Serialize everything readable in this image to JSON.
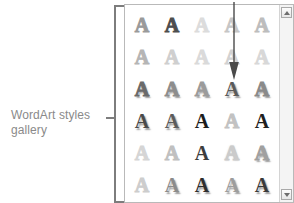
{
  "figure": {
    "width": 294,
    "height": 203,
    "background": "#ffffff"
  },
  "callout": {
    "label": "WordArt styles\ngallery",
    "text_color": "#8a8a8a",
    "bracket_color": "#7d7d7d",
    "bracket_name": "bracket-leader"
  },
  "annotation": {
    "arrow_name": "pointer-arrow",
    "arrow_color": "#4a4a4a",
    "points_to_row": 3,
    "points_to_column": 4
  },
  "gallery": {
    "title": "WordArt styles gallery",
    "panel_border": "#b9b9b9",
    "panel_background": "#ffffff",
    "columns": 5,
    "visible_rows": 6,
    "sample_letter": "A",
    "rows": [
      {
        "row": 1,
        "cells": [
          {
            "letter": "A",
            "style": "outline",
            "color": "#9a9a9a"
          },
          {
            "letter": "A",
            "style": "outline",
            "color": "#4e4e4e"
          },
          {
            "letter": "A",
            "style": "outline",
            "color": "#dcdcdc"
          },
          {
            "letter": "A",
            "style": "outline",
            "color": "#c6c6c6"
          },
          {
            "letter": "A",
            "style": "outline",
            "color": "#bdbdbd"
          }
        ]
      },
      {
        "row": 2,
        "cells": [
          {
            "letter": "A",
            "style": "outline",
            "color": "#b5b5b5"
          },
          {
            "letter": "A",
            "style": "outline",
            "color": "#cfcfcf"
          },
          {
            "letter": "A",
            "style": "outline",
            "color": "#dadada"
          },
          {
            "letter": "A",
            "style": "outline",
            "color": "#d2d2d2"
          },
          {
            "letter": "A",
            "style": "outline",
            "color": "#d8d8d8"
          }
        ]
      },
      {
        "row": 3,
        "cells": [
          {
            "letter": "A",
            "style": "outline-shadow",
            "color": "#6a6a6a"
          },
          {
            "letter": "A",
            "style": "outline-shadow",
            "color": "#8d8d8d"
          },
          {
            "letter": "A",
            "style": "outline-shadow",
            "color": "#9b9b9b"
          },
          {
            "letter": "A",
            "style": "solid-shadow",
            "color": "#5a5a5a"
          },
          {
            "letter": "A",
            "style": "outline-shadow",
            "color": "#8a8a8a"
          }
        ]
      },
      {
        "row": 4,
        "cells": [
          {
            "letter": "A",
            "style": "solid-shadow",
            "color": "#4a4a4a"
          },
          {
            "letter": "A",
            "style": "solid-shadow",
            "color": "#5c5c5c"
          },
          {
            "letter": "A",
            "style": "solid",
            "color": "#1d1d1d"
          },
          {
            "letter": "A",
            "style": "outline",
            "color": "#c2c2c2"
          },
          {
            "letter": "A",
            "style": "solid",
            "color": "#202020"
          }
        ]
      },
      {
        "row": 5,
        "cells": [
          {
            "letter": "A",
            "style": "outline",
            "color": "#d5d5d5"
          },
          {
            "letter": "A",
            "style": "outline",
            "color": "#c0c0c0"
          },
          {
            "letter": "A",
            "style": "solid",
            "color": "#3d3d3d"
          },
          {
            "letter": "A",
            "style": "outline-soft",
            "color": "#cbcbcb"
          },
          {
            "letter": "A",
            "style": "outline-shadow",
            "color": "#a0a0a0"
          }
        ]
      },
      {
        "row": 6,
        "cells": [
          {
            "letter": "A",
            "style": "outline",
            "color": "#cdcdcd"
          },
          {
            "letter": "A",
            "style": "solid-shadow",
            "color": "#8b8b8b"
          },
          {
            "letter": "A",
            "style": "solid-shadow",
            "color": "#2e2e2e"
          },
          {
            "letter": "A",
            "style": "solid-shadow",
            "color": "#9d9d9d"
          },
          {
            "letter": "A",
            "style": "solid-shadow",
            "color": "#3a3a3a"
          }
        ]
      }
    ],
    "scrollbar": {
      "up_icon": "triangle-up-icon",
      "down_icon": "triangle-down-icon",
      "track_color": "#f4f4f4"
    }
  }
}
